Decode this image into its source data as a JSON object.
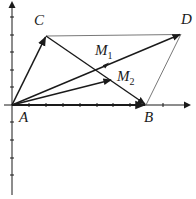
{
  "diagram": {
    "colors": {
      "ink": "#1a1a1a",
      "light_line": "#555555",
      "background": "#ffffff"
    },
    "points": {
      "A": {
        "label": "A",
        "x": 12,
        "y": 105
      },
      "B": {
        "label": "B",
        "x": 146,
        "y": 105
      },
      "C": {
        "label": "C",
        "x": 46,
        "y": 36
      },
      "D": {
        "label": "D",
        "x": 181,
        "y": 34
      },
      "M1": {
        "label": "M",
        "sub": "1",
        "x": 97,
        "y": 69
      },
      "M2": {
        "label": "M",
        "sub": "2",
        "x": 112,
        "y": 80
      }
    },
    "labels": {
      "A": "A",
      "B": "B",
      "C": "C",
      "D": "D",
      "M1_main": "M",
      "M1_sub": "1",
      "M2_main": "M",
      "M2_sub": "2"
    },
    "axes": {
      "x_axis": {
        "y": 105,
        "from": 4,
        "to": 190,
        "ticks": [
          29,
          46,
          63,
          80,
          97,
          113,
          130,
          163
        ]
      },
      "y_axis": {
        "x": 12,
        "from": 2,
        "to": 195,
        "ticks": [
          17,
          35,
          52,
          70,
          87,
          122,
          140,
          158,
          175
        ]
      }
    },
    "vectors": [
      "A→C",
      "A→B",
      "A→D",
      "A→M2",
      "C→B",
      "C→D(thin)",
      "B→D(thin)"
    ]
  }
}
